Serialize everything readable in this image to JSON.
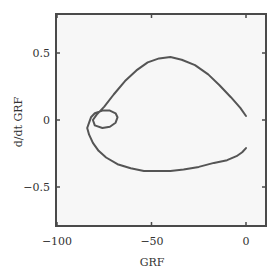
{
  "chart_data": {
    "type": "line",
    "title": "",
    "xlabel": "GRF",
    "ylabel": "d/dt GRF",
    "xlim": [
      -100,
      10
    ],
    "ylim": [
      -0.8,
      0.8
    ],
    "xticks": [
      -100,
      -50,
      0
    ],
    "xtick_labels": [
      "−100",
      "−50",
      "0"
    ],
    "yticks": [
      -0.5,
      0,
      0.5
    ],
    "ytick_labels": [
      "−0.5",
      "0",
      "0.5"
    ],
    "grid": false,
    "legend": null,
    "series": [
      {
        "name": "phase trajectory",
        "color": "#555555",
        "x": [
          0,
          -3,
          -8,
          -14,
          -20,
          -27,
          -34,
          -40,
          -46,
          -52,
          -58,
          -64,
          -70,
          -75,
          -79,
          -81,
          -80,
          -76,
          -72,
          -69,
          -68,
          -69,
          -72,
          -76,
          -80,
          -82,
          -83,
          -84,
          -83,
          -81,
          -78,
          -74,
          -68,
          -61,
          -54,
          -47,
          -40,
          -33,
          -25,
          -17,
          -10,
          -5,
          -2,
          0
        ],
        "y": [
          0.03,
          0.09,
          0.17,
          0.26,
          0.34,
          0.41,
          0.45,
          0.47,
          0.46,
          0.43,
          0.37,
          0.29,
          0.19,
          0.1,
          0.04,
          0.0,
          -0.04,
          -0.06,
          -0.05,
          -0.02,
          0.02,
          0.05,
          0.07,
          0.07,
          0.05,
          0.02,
          -0.02,
          -0.06,
          -0.11,
          -0.17,
          -0.23,
          -0.28,
          -0.33,
          -0.36,
          -0.38,
          -0.38,
          -0.38,
          -0.37,
          -0.35,
          -0.32,
          -0.3,
          -0.27,
          -0.24,
          -0.21
        ]
      }
    ]
  },
  "axes": {
    "x_label": "GRF",
    "y_label": "d/dt GRF",
    "x_ticks": [
      "−100",
      "−50",
      "0"
    ],
    "y_ticks": [
      "0.5",
      "0",
      "−0.5"
    ]
  }
}
